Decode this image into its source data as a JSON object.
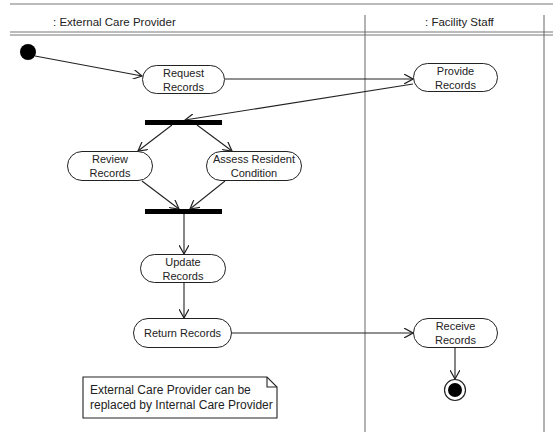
{
  "diagram": {
    "type": "UML activity diagram",
    "swimlanes": [
      {
        "id": "lane-external",
        "title": ": External Care Provider"
      },
      {
        "id": "lane-facility",
        "title": ": Facility Staff"
      }
    ],
    "actions": {
      "request_records": "Request\nRecords",
      "provide_records": "Provide\nRecords",
      "review_records": "Review\nRecords",
      "assess_condition": "Assess Resident\nCondition",
      "update_records": "Update\nRecords",
      "return_records": "Return Records",
      "receive_records": "Receive\nRecords"
    },
    "note": "External Care Provider can be\nreplaced by Internal Care Provider",
    "flows": [
      [
        "initial",
        "request_records"
      ],
      [
        "request_records",
        "provide_records"
      ],
      [
        "provide_records",
        "fork"
      ],
      [
        "fork",
        "review_records"
      ],
      [
        "fork",
        "assess_condition"
      ],
      [
        "review_records",
        "join"
      ],
      [
        "assess_condition",
        "join"
      ],
      [
        "join",
        "update_records"
      ],
      [
        "update_records",
        "return_records"
      ],
      [
        "return_records",
        "receive_records"
      ],
      [
        "receive_records",
        "final"
      ]
    ],
    "colors": {
      "line": "#222222",
      "frame": "#666666",
      "background": "#ffffff"
    }
  }
}
